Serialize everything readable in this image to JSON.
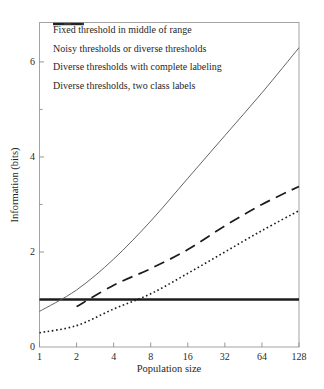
{
  "figure": {
    "background": "#ffffff",
    "border_color": "#a3a3a3",
    "tick_color": "#8c8c8c",
    "text_color": "#1f1f1f"
  },
  "chart_data": {
    "type": "line",
    "title": "",
    "xlabel": "Population size",
    "ylabel": "Information (bits)",
    "x_scale": "log2",
    "xlim": [
      1,
      128
    ],
    "ylim": [
      0,
      6.83
    ],
    "grid": false,
    "legend_position": "top-left inside, no frame",
    "x_tick_labels": [
      "1",
      "2",
      "4",
      "8",
      "16",
      "32",
      "64",
      "128"
    ],
    "x_tick_values": [
      1,
      2,
      4,
      8,
      16,
      32,
      64,
      128
    ],
    "y_tick_labels": [
      "0",
      "2",
      "4",
      "6"
    ],
    "y_tick_values": [
      0,
      2,
      4,
      6
    ],
    "y_minor_tick_values": [
      1,
      3,
      5
    ],
    "series": [
      {
        "name": "Fixed threshold in middle of range",
        "style": "solid-thick",
        "color": "#1c1c1c",
        "points": [
          [
            1,
            1
          ],
          [
            128,
            1
          ]
        ]
      },
      {
        "name": "Noisy thresholds or diverse thresholds",
        "style": "dotted",
        "color": "#1c1c1c",
        "points": [
          [
            1,
            0.3
          ],
          [
            2,
            0.45
          ],
          [
            4,
            0.8
          ],
          [
            8,
            1.12
          ],
          [
            16,
            1.55
          ],
          [
            32,
            2.0
          ],
          [
            64,
            2.45
          ],
          [
            128,
            2.87
          ]
        ]
      },
      {
        "name": "Diverse thresholds with complete labeling",
        "style": "solid-thin",
        "color": "#5c5c5c",
        "points": [
          [
            1,
            0.75
          ],
          [
            2,
            1.2
          ],
          [
            4,
            1.85
          ],
          [
            8,
            2.65
          ],
          [
            16,
            3.55
          ],
          [
            32,
            4.45
          ],
          [
            64,
            5.35
          ],
          [
            128,
            6.3
          ]
        ]
      },
      {
        "name": "Diverse thresholds, two class labels",
        "style": "dashed",
        "color": "#1c1c1c",
        "points": [
          [
            2,
            0.85
          ],
          [
            4,
            1.3
          ],
          [
            8,
            1.65
          ],
          [
            16,
            2.05
          ],
          [
            32,
            2.55
          ],
          [
            64,
            3.0
          ],
          [
            128,
            3.38
          ]
        ]
      }
    ]
  }
}
